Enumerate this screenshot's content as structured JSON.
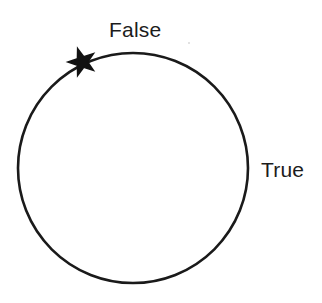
{
  "figure": {
    "type": "state-circle-diagram",
    "background_color": "#ffffff",
    "stroke_color": "#1a1a1a",
    "text_color": "#1c1c1c"
  },
  "labels": {
    "top": "False",
    "right": "True"
  },
  "chart_data": {
    "type": "diagram",
    "title": "",
    "xlabel": "",
    "ylabel": "",
    "shapes": [
      {
        "name": "state-circle",
        "kind": "circle",
        "cx": 133,
        "cy": 168,
        "r": 115,
        "stroke": "#1a1a1a",
        "stroke_width": 2.6,
        "fill": "none"
      },
      {
        "name": "state-marker",
        "kind": "star",
        "points": 5,
        "cx": 82,
        "cy": 62,
        "outer_radius": 14,
        "inner_radius": 5.6,
        "rotation_deg": -18,
        "fill": "#121212"
      }
    ],
    "annotations": [
      {
        "name": "label-false",
        "text": "False",
        "x": 134,
        "y": 30,
        "anchor": "middle"
      },
      {
        "name": "label-true",
        "text": "True",
        "x": 285,
        "y": 170,
        "anchor": "middle"
      }
    ],
    "legend": [],
    "grid": false
  }
}
